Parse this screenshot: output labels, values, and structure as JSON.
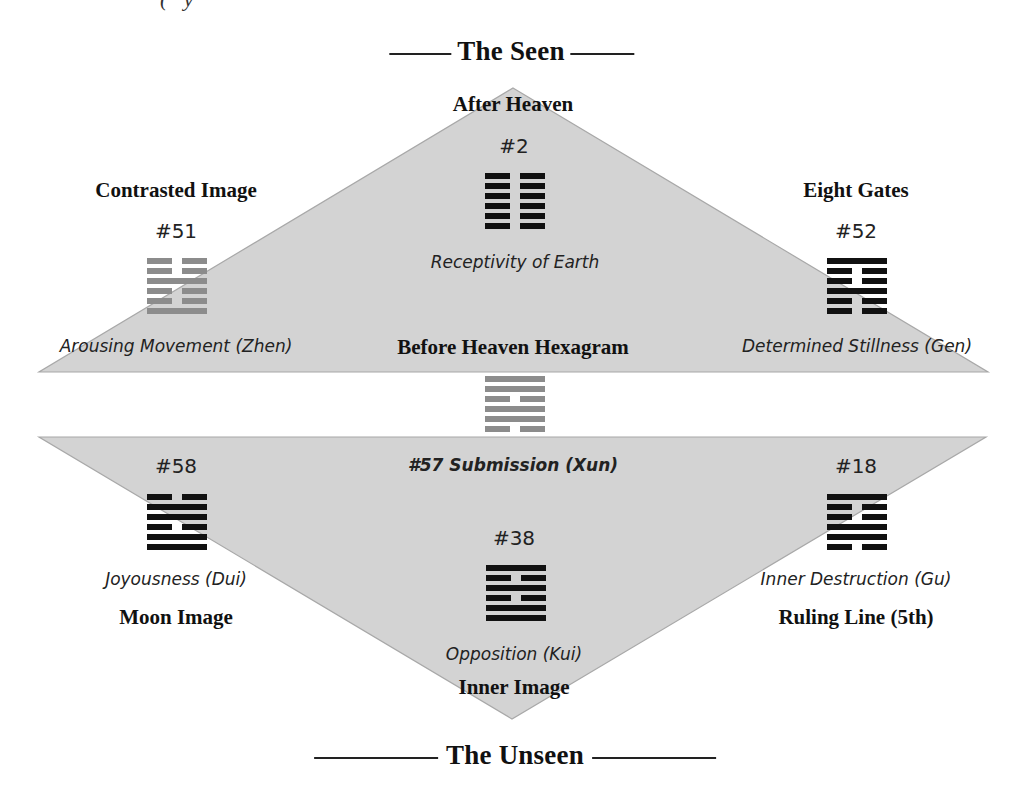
{
  "header": {
    "top_crop_text": "(  ·  y",
    "title": "The Seen"
  },
  "footer": {
    "title": "The Unseen"
  },
  "colors": {
    "triangle_fill": "#d3d3d3",
    "triangle_edge": "#a8a8a8",
    "hexagram_dark": "#111111",
    "hexagram_gray": "#8c8c8c"
  },
  "upper_triangle": {
    "apex_label": "After Heaven",
    "base_label": "Before Heaven Hexagram"
  },
  "lower_triangle": {
    "apex_label": "Inner Image"
  },
  "hexagrams": {
    "after_heaven": {
      "number": "#2",
      "name": "Receptivity of Earth",
      "lines": [
        "broken",
        "broken",
        "broken",
        "broken",
        "broken",
        "broken"
      ],
      "color": "dark"
    },
    "contrasted": {
      "section": "Contrasted Image",
      "number": "#51",
      "name": "Arousing Movement (Zhen)",
      "lines": [
        "broken",
        "broken",
        "solid",
        "broken",
        "broken",
        "solid"
      ],
      "color": "gray"
    },
    "eight_gates": {
      "section": "Eight Gates",
      "number": "#52",
      "name": "Determined Stillness (Gen)",
      "lines": [
        "solid",
        "broken",
        "broken",
        "solid",
        "broken",
        "broken"
      ],
      "color": "dark"
    },
    "before_heaven": {
      "number_name": "#57 Submission (Xun)",
      "lines": [
        "solid",
        "solid",
        "broken",
        "solid",
        "solid",
        "broken"
      ],
      "color": "gray"
    },
    "moon": {
      "section": "Moon Image",
      "number": "#58",
      "name": "Joyousness (Dui)",
      "lines": [
        "broken",
        "solid",
        "solid",
        "broken",
        "solid",
        "solid"
      ],
      "color": "dark"
    },
    "ruling_line": {
      "section": "Ruling Line (5th)",
      "number": "#18",
      "name": "Inner Destruction (Gu)",
      "lines": [
        "solid",
        "broken",
        "broken",
        "solid",
        "solid",
        "broken"
      ],
      "color": "dark"
    },
    "inner": {
      "number": "#38",
      "name": "Opposition (Kui)",
      "lines": [
        "solid",
        "broken",
        "solid",
        "broken",
        "solid",
        "solid"
      ],
      "color": "dark"
    }
  }
}
